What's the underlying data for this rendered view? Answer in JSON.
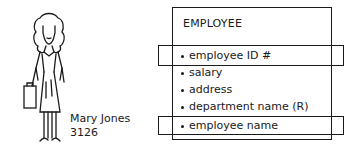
{
  "person": {
    "name": "Mary Jones",
    "id": "3126",
    "icon": "woman-with-briefcase-sketch"
  },
  "entity": {
    "title": "EMPLOYEE",
    "attributes": [
      {
        "label": "employee ID #",
        "highlighted": true
      },
      {
        "label": "salary",
        "highlighted": false
      },
      {
        "label": "address",
        "highlighted": false
      },
      {
        "label": "department name (R)",
        "highlighted": false
      },
      {
        "label": "employee name",
        "highlighted": true
      }
    ]
  }
}
